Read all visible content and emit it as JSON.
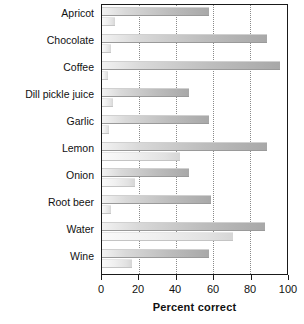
{
  "chart_data": {
    "type": "bar",
    "orientation": "horizontal",
    "title": "",
    "xlabel": "Percent correct",
    "ylabel": "",
    "xlim": [
      0,
      100
    ],
    "xticks": [
      0,
      20,
      40,
      60,
      80,
      100
    ],
    "grid": true,
    "grid_axis": "x",
    "legend": "none",
    "categories": [
      "Apricot",
      "Chocolate",
      "Coffee",
      "Dill pickle juice",
      "Garlic",
      "Lemon",
      "Onion",
      "Root beer",
      "Water",
      "Wine"
    ],
    "series": [
      {
        "name": "series-a",
        "color": "#b5b5b5",
        "values": [
          58,
          89,
          96,
          47,
          58,
          89,
          47,
          59,
          88,
          58
        ]
      },
      {
        "name": "series-b",
        "color": "#ededed",
        "values": [
          7,
          5,
          3,
          6,
          4,
          42,
          18,
          5,
          71,
          16
        ]
      }
    ]
  },
  "axis": {
    "x_tick_labels": [
      "0",
      "20",
      "40",
      "60",
      "80",
      "100"
    ],
    "x_axis_title": "Percent correct"
  }
}
